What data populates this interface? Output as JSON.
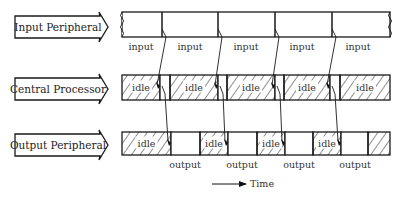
{
  "rows": [
    {
      "label": "Input Peripheral",
      "y": 12,
      "h": 25
    },
    {
      "label": "Central Processor",
      "y": 75,
      "h": 25
    },
    {
      "label": "Output Peripheral",
      "y": 132,
      "h": 23
    }
  ],
  "input_row": {
    "x_start": 122,
    "x_end": 390,
    "dividers": [
      162,
      218,
      275,
      332
    ],
    "labels": [
      {
        "text": "input",
        "x": 141
      },
      {
        "text": "input",
        "x": 190
      },
      {
        "text": "input",
        "x": 246
      },
      {
        "text": "input",
        "x": 302
      },
      {
        "text": "input",
        "x": 358
      }
    ]
  },
  "cpu_row": {
    "segments": [
      {
        "type": "idle",
        "x1": 122,
        "x2": 160,
        "label": "idle"
      },
      {
        "type": "busy",
        "x1": 160,
        "x2": 170
      },
      {
        "type": "idle",
        "x1": 170,
        "x2": 218,
        "label": "idle"
      },
      {
        "type": "busy",
        "x1": 218,
        "x2": 227
      },
      {
        "type": "idle",
        "x1": 227,
        "x2": 275,
        "label": "idle"
      },
      {
        "type": "busy",
        "x1": 275,
        "x2": 284
      },
      {
        "type": "idle",
        "x1": 284,
        "x2": 330,
        "label": "idle"
      },
      {
        "type": "busy",
        "x1": 330,
        "x2": 340
      },
      {
        "type": "idle",
        "x1": 340,
        "x2": 390,
        "label": "idle"
      }
    ]
  },
  "output_row": {
    "segments": [
      {
        "type": "idle",
        "x1": 122,
        "x2": 171,
        "label": "idle"
      },
      {
        "type": "busy",
        "x1": 171,
        "x2": 200
      },
      {
        "type": "idle",
        "x1": 200,
        "x2": 228,
        "label": "idle"
      },
      {
        "type": "busy",
        "x1": 228,
        "x2": 257
      },
      {
        "type": "idle",
        "x1": 257,
        "x2": 285,
        "label": "idle"
      },
      {
        "type": "busy",
        "x1": 285,
        "x2": 313
      },
      {
        "type": "idle",
        "x1": 313,
        "x2": 341,
        "label": "idle"
      },
      {
        "type": "busy",
        "x1": 341,
        "x2": 368
      },
      {
        "type": "idle",
        "x1": 368,
        "x2": 390,
        "label": ""
      }
    ],
    "labels": [
      {
        "text": "output",
        "x": 185
      },
      {
        "text": "output",
        "x": 242
      },
      {
        "text": "output",
        "x": 299
      },
      {
        "text": "output",
        "x": 355
      }
    ]
  },
  "time_axis": {
    "label": "Time",
    "x1": 212,
    "x2": 246,
    "y": 184
  }
}
